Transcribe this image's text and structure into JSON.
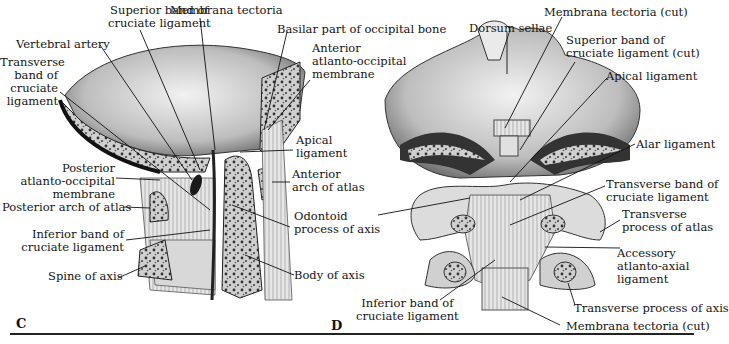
{
  "figure": {
    "panels": [
      {
        "id": "C",
        "letter": "C",
        "view": "median sagittal section",
        "labels": [
          "Superior band of\ncruciate ligament",
          "Membrana tectoria",
          "Basilar part of occipital bone",
          "Vertebral artery",
          "Transverse\nband of\ncruciate\nligament",
          "Anterior\natlanto-occipital\nmembrane",
          "Apical\nligament",
          "Posterior\natlanto-occipital\nmembrane",
          "Anterior\narch of atlas",
          "Posterior arch of atlas",
          "Odontoid\nprocess of axis",
          "Inferior band of\ncruciate ligament",
          "Spine of axis",
          "Body of axis"
        ]
      },
      {
        "id": "D",
        "letter": "D",
        "view": "posterior view",
        "labels": [
          "Membrana tectoria (cut)",
          "Dorsum sellae",
          "Superior band of\ncruciate ligament (cut)",
          "Apical ligament",
          "Alar ligament",
          "Transverse band of\ncruciate ligament",
          "Transverse\nprocess of atlas",
          "Accessory\natlanto-axial\nligament",
          "Inferior band of\ncruciate ligament",
          "Transverse process of axis",
          "Membrana tectoria (cut)"
        ]
      }
    ]
  },
  "C": {
    "letter": "C",
    "sup_band_1": "Superior band of",
    "sup_band_2": "cruciate ligament",
    "membrana": "Membrana tectoria",
    "basilar": "Basilar part of occipital bone",
    "vertebral": "Vertebral artery",
    "transverse_1": "Transverse",
    "transverse_2": "band of",
    "transverse_3": "cruciate",
    "transverse_4": "ligament",
    "ant_ao_1": "Anterior",
    "ant_ao_2": "atlanto-occipital",
    "ant_ao_3": "membrane",
    "apical_1": "Apical",
    "apical_2": "ligament",
    "post_ao_1": "Posterior",
    "post_ao_2": "atlanto-occipital",
    "post_ao_3": "membrane",
    "ant_arch_1": "Anterior",
    "ant_arch_2": "arch of atlas",
    "post_arch": "Posterior arch of atlas",
    "odontoid_1": "Odontoid",
    "odontoid_2": "process of axis",
    "inf_band_1": "Inferior band of",
    "inf_band_2": "cruciate ligament",
    "spine": "Spine of axis",
    "body": "Body of axis"
  },
  "D": {
    "letter": "D",
    "membrana_top": "Membrana tectoria (cut)",
    "dorsum": "Dorsum sellae",
    "sup_band_1": "Superior band of",
    "sup_band_2": "cruciate ligament (cut)",
    "apical": "Apical ligament",
    "alar": "Alar ligament",
    "transverse_1": "Transverse band of",
    "transverse_2": "cruciate ligament",
    "tp_atlas_1": "Transverse",
    "tp_atlas_2": "process of atlas",
    "accessory_1": "Accessory",
    "accessory_2": "atlanto-axial",
    "accessory_3": "ligament",
    "inf_band_1": "Inferior band of",
    "inf_band_2": "cruciate ligament",
    "tp_axis": "Transverse process of axis",
    "membrana_bottom": "Membrana tectoria (cut)"
  }
}
